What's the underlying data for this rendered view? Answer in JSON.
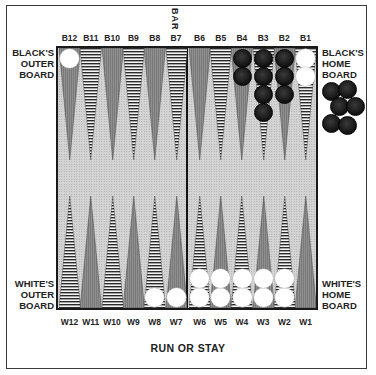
{
  "title": "RUN OR STAY",
  "bar_label": "BAR",
  "labels": {
    "black_outer": [
      "BLACK'S",
      "OUTER",
      "BOARD"
    ],
    "black_home": [
      "BLACK'S",
      "HOME",
      "BOARD"
    ],
    "white_outer": [
      "WHITE'S",
      "OUTER",
      "BOARD"
    ],
    "white_home": [
      "WHITE'S",
      "HOME",
      "BOARD"
    ]
  },
  "colors": {
    "board_bg": "#d4d4d4",
    "solid_point": "#8f8f8f",
    "striped_point_line": "#2a2a2a",
    "white_checker": "#ffffff",
    "black_checker": "#111111",
    "frame": "#3a3a3a"
  },
  "top_points": [
    {
      "label": "B12",
      "style": "solid",
      "white": 1,
      "black": 0
    },
    {
      "label": "B11",
      "style": "striped",
      "white": 0,
      "black": 0
    },
    {
      "label": "B10",
      "style": "solid",
      "white": 0,
      "black": 0
    },
    {
      "label": "B9",
      "style": "striped",
      "white": 0,
      "black": 0
    },
    {
      "label": "B8",
      "style": "solid",
      "white": 0,
      "black": 0
    },
    {
      "label": "B7",
      "style": "striped",
      "white": 0,
      "black": 0
    },
    {
      "label": "B6",
      "style": "solid",
      "white": 0,
      "black": 0
    },
    {
      "label": "B5",
      "style": "striped",
      "white": 0,
      "black": 0
    },
    {
      "label": "B4",
      "style": "solid",
      "white": 0,
      "black": 2
    },
    {
      "label": "B3",
      "style": "striped",
      "white": 0,
      "black": 4
    },
    {
      "label": "B2",
      "style": "solid",
      "white": 0,
      "black": 3
    },
    {
      "label": "B1",
      "style": "striped",
      "white": 2,
      "black": 0
    }
  ],
  "bottom_points": [
    {
      "label": "W12",
      "style": "striped",
      "white": 0,
      "black": 0
    },
    {
      "label": "W11",
      "style": "solid",
      "white": 0,
      "black": 0
    },
    {
      "label": "W10",
      "style": "striped",
      "white": 0,
      "black": 0
    },
    {
      "label": "W9",
      "style": "solid",
      "white": 0,
      "black": 0
    },
    {
      "label": "W8",
      "style": "striped",
      "white": 1,
      "black": 0
    },
    {
      "label": "W7",
      "style": "solid",
      "white": 1,
      "black": 0
    },
    {
      "label": "W6",
      "style": "striped",
      "white": 2,
      "black": 0
    },
    {
      "label": "W5",
      "style": "solid",
      "white": 2,
      "black": 0
    },
    {
      "label": "W4",
      "style": "striped",
      "white": 2,
      "black": 0
    },
    {
      "label": "W3",
      "style": "solid",
      "white": 2,
      "black": 0
    },
    {
      "label": "W2",
      "style": "striped",
      "white": 2,
      "black": 0
    },
    {
      "label": "W1",
      "style": "solid",
      "white": 0,
      "black": 0
    }
  ],
  "black_borne_off": 6
}
